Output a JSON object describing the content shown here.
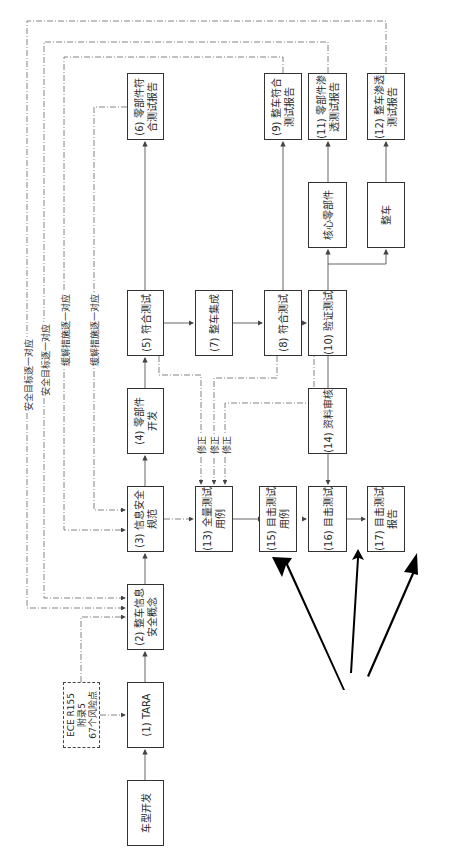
{
  "diagram": {
    "orientation": "rotated-90-ccw",
    "nodes": {
      "vehicle_dev": {
        "label": "车型开发"
      },
      "tara": {
        "label": "(1) TARA"
      },
      "ece": {
        "line1": "ECE R155",
        "line2": "附录5",
        "line3": "67个风险点"
      },
      "n2": {
        "line1": "(2) 整车信息",
        "line2": "安全概念"
      },
      "n3": {
        "line1": "(3) 信息安全",
        "line2": "规范"
      },
      "n4": {
        "line1": "(4) 零部件",
        "line2": "开发"
      },
      "n5": {
        "label": "(5) 符合测试"
      },
      "n6": {
        "line1": "(6) 零部件符",
        "line2": "合测试报告"
      },
      "n7": {
        "label": "(7) 整车集成"
      },
      "n8": {
        "label": "(8) 符合测试"
      },
      "n9": {
        "line1": "(9) 整车符合",
        "line2": "测试报告"
      },
      "n10": {
        "label": "(10) 验证测试"
      },
      "core": {
        "label": "核心零部件"
      },
      "vehicle": {
        "label": "整车"
      },
      "n11": {
        "line1": "(11) 零部件渗",
        "line2": "透测试报告"
      },
      "n12": {
        "line1": "(12) 整车渗透",
        "line2": "测试报告"
      },
      "n13": {
        "line1": "(13) 全量测试",
        "line2": "用例"
      },
      "n14": {
        "label": "(14) 资料审核"
      },
      "n15": {
        "line1": "(15) 目击测试",
        "line2": "用例"
      },
      "n16": {
        "label": "(16) 目击测试"
      },
      "n17": {
        "line1": "(17) 目击测试",
        "line2": "报告"
      }
    },
    "edge_labels": {
      "trace1": "安全目标逐一对应",
      "trace2": "安全目标逐一对应",
      "trace3": "缓解措施逐一对应",
      "trace4": "缓解措施逐一对应",
      "fix1": "修正",
      "fix2": "修正",
      "fix3": "修正"
    },
    "colors": {
      "line": "#555555",
      "box_border": "#333333",
      "big_arrow": "#000000"
    }
  }
}
